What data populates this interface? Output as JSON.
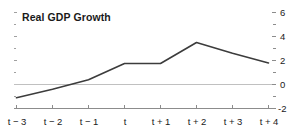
{
  "chart_data": {
    "type": "line",
    "title": "Real GDP Growth",
    "xlabel": "",
    "ylabel": "",
    "categories": [
      "t − 3",
      "t − 2",
      "t − 1",
      "t",
      "t + 1",
      "t + 2",
      "t + 3",
      "t + 4"
    ],
    "values": [
      -1.1,
      -0.4,
      0.4,
      1.75,
      1.75,
      3.5,
      2.6,
      1.8
    ],
    "ylim": [
      -2,
      6
    ],
    "yticks": [
      -2,
      0,
      2,
      4,
      6
    ],
    "ytick_labels": [
      "-2",
      "0",
      "2",
      "4",
      "6"
    ],
    "y_axis_position": "right",
    "grid": false,
    "zero_line": true,
    "legend": "none",
    "series": [
      {
        "name": "Real GDP Growth",
        "color": "#3c3c3c",
        "values": [
          -1.1,
          -0.4,
          0.4,
          1.75,
          1.75,
          3.5,
          2.6,
          1.8
        ]
      }
    ],
    "colors": {
      "line": "#3c3c3c",
      "axis": "#8c8c8c",
      "zero_line": "#b4b4b4",
      "text": "#1a1a1a",
      "background": "#ffffff"
    }
  }
}
